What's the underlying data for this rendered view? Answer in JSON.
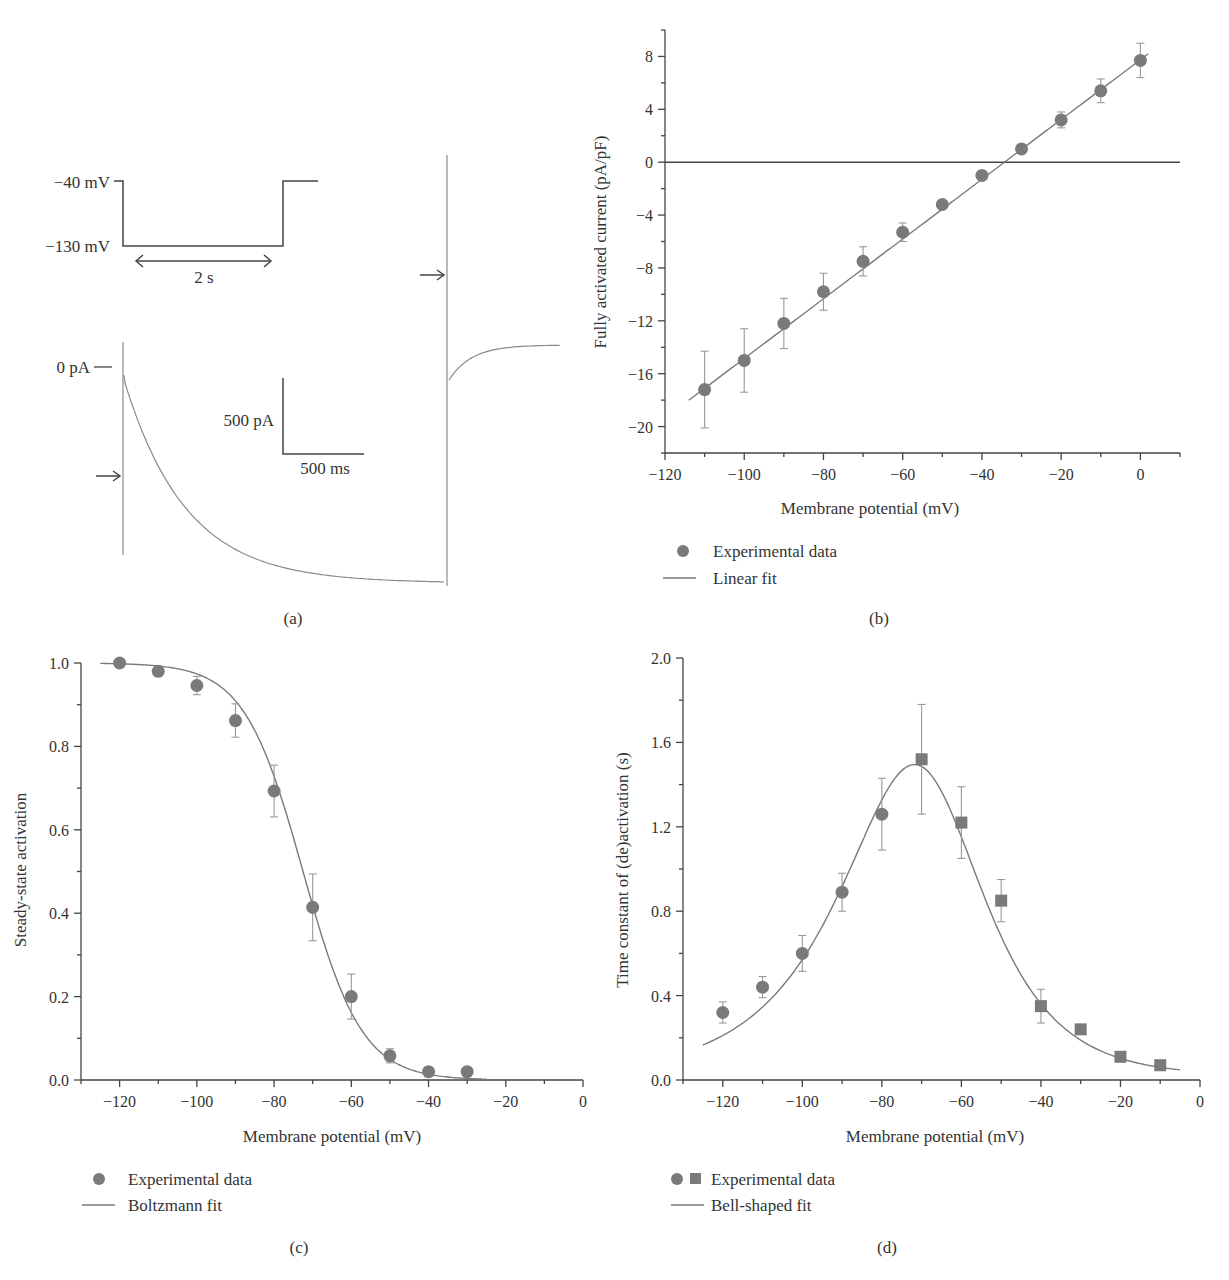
{
  "colors": {
    "marker": "#7a7a7a",
    "line": "#7a7a7a",
    "axis": "#444444",
    "text": "#333333",
    "trace": "#8a8a8a"
  },
  "panel_a": {
    "label": "(a)",
    "protocol": {
      "v_hold_label": "−40 mV",
      "v_step_label": "−130 mV",
      "duration_label": "2 s"
    },
    "current": {
      "zero_label": "0 pA",
      "scale_y_label": "500 pA",
      "scale_x_label": "500 ms"
    },
    "arrows": [
      "activation-arrow",
      "tail-arrow"
    ]
  },
  "chart_data": [
    {
      "id": "b",
      "type": "scatter",
      "panel_label": "(b)",
      "title": "",
      "xlabel": "Membrane potential (mV)",
      "ylabel": "Fully activated current (pA/pF)",
      "xlim": [
        -120,
        10
      ],
      "ylim": [
        -22,
        10
      ],
      "xticks": [
        -120,
        -100,
        -80,
        -60,
        -40,
        -20,
        0
      ],
      "yticks": [
        8,
        4,
        0,
        -4,
        -8,
        -12,
        -16,
        -20
      ],
      "grid": false,
      "zero_line": true,
      "legend": [
        {
          "marker": "circle",
          "label": "Experimental data"
        },
        {
          "marker": "line",
          "label": "Linear fit"
        }
      ],
      "legend_position": "below",
      "series": [
        {
          "name": "Experimental data",
          "marker": "circle",
          "x": [
            -110,
            -100,
            -90,
            -80,
            -70,
            -60,
            -50,
            -40,
            -30,
            -20,
            -10,
            0
          ],
          "y": [
            -17.2,
            -15.0,
            -12.2,
            -9.8,
            -7.5,
            -5.3,
            -3.2,
            -1.0,
            1.0,
            3.2,
            5.4,
            7.7
          ],
          "err": [
            2.9,
            2.4,
            1.9,
            1.4,
            1.1,
            0.7,
            0.3,
            0.3,
            0.3,
            0.6,
            0.9,
            1.3
          ]
        }
      ],
      "fit": {
        "name": "Linear fit",
        "kind": "linear",
        "slope": 0.226,
        "intercept": 7.75,
        "x_range": [
          -114,
          2
        ]
      }
    },
    {
      "id": "c",
      "type": "scatter",
      "panel_label": "(c)",
      "title": "",
      "xlabel": "Membrane potential (mV)",
      "ylabel": "Steady-state activation",
      "xlim": [
        -130,
        0
      ],
      "ylim": [
        0,
        1.0
      ],
      "xticks": [
        -120,
        -100,
        -80,
        -60,
        -40,
        -20,
        0
      ],
      "yticks": [
        0.0,
        0.2,
        0.4,
        0.6,
        0.8,
        1.0
      ],
      "grid": false,
      "legend": [
        {
          "marker": "circle",
          "label": "Experimental data"
        },
        {
          "marker": "line",
          "label": "Boltzmann fit"
        }
      ],
      "legend_position": "below",
      "series": [
        {
          "name": "Experimental data",
          "marker": "circle",
          "x": [
            -120,
            -110,
            -100,
            -90,
            -80,
            -70,
            -60,
            -50,
            -40,
            -30
          ],
          "y": [
            1.0,
            0.98,
            0.946,
            0.862,
            0.693,
            0.414,
            0.2,
            0.058,
            0.02,
            0.02
          ],
          "err": [
            0,
            0,
            0.022,
            0.04,
            0.062,
            0.08,
            0.054,
            0.017,
            0,
            0
          ]
        }
      ],
      "fit": {
        "name": "Boltzmann fit",
        "kind": "boltzmann",
        "v_half": -72.5,
        "k": 7.6,
        "x_range": [
          -125,
          -25
        ]
      }
    },
    {
      "id": "d",
      "type": "scatter",
      "panel_label": "(d)",
      "title": "",
      "xlabel": "Membrane potential (mV)",
      "ylabel": "Time constant of (de)activation (s)",
      "xlim": [
        -130,
        0
      ],
      "ylim": [
        0,
        2.0
      ],
      "xticks": [
        -120,
        -100,
        -80,
        -60,
        -40,
        -20,
        0
      ],
      "yticks": [
        0.0,
        0.4,
        0.8,
        1.2,
        1.6,
        2.0
      ],
      "grid": false,
      "legend": [
        {
          "marker": "circle+square",
          "label": "Experimental data"
        },
        {
          "marker": "line",
          "label": "Bell-shaped fit"
        }
      ],
      "legend_position": "below",
      "series": [
        {
          "name": "Activation (circles)",
          "marker": "circle",
          "x": [
            -120,
            -110,
            -100,
            -90,
            -80
          ],
          "y": [
            0.32,
            0.44,
            0.6,
            0.89,
            1.26
          ],
          "err": [
            0.05,
            0.05,
            0.085,
            0.09,
            0.17
          ]
        },
        {
          "name": "Deactivation (squares)",
          "marker": "square",
          "x": [
            -70,
            -60,
            -50,
            -40,
            -30,
            -20,
            -10
          ],
          "y": [
            1.52,
            1.22,
            0.85,
            0.35,
            0.24,
            0.11,
            0.07
          ],
          "err": [
            0.26,
            0.17,
            0.1,
            0.08,
            0,
            0,
            0
          ]
        }
      ],
      "fit": {
        "name": "Bell-shaped fit",
        "kind": "bell",
        "peak_x": -69.5,
        "peak_y": 1.48,
        "x_range": [
          -125,
          -5
        ]
      }
    }
  ]
}
